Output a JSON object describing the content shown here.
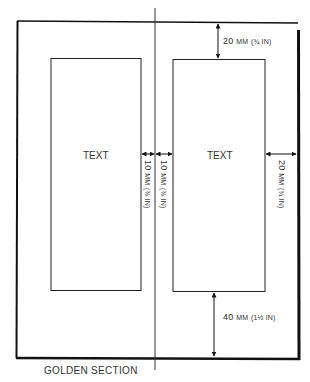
{
  "diagram": {
    "caption": "GOLDEN SECTION",
    "pages": [
      {
        "side": "left",
        "label": "TEXT"
      },
      {
        "side": "right",
        "label": "TEXT"
      }
    ],
    "dimensions": {
      "top_margin": {
        "value": "20",
        "unit": "MM",
        "imperial": "(¾ IN)"
      },
      "inner_margin_left": {
        "value": "10",
        "unit": "MM",
        "imperial": "(⅜ IN)"
      },
      "inner_margin_right": {
        "value": "10",
        "unit": "MM",
        "imperial": "(⅜ IN)"
      },
      "outer_margin": {
        "value": "20",
        "unit": "MM",
        "imperial": "(¾ IN)"
      },
      "bottom_margin": {
        "value": "40",
        "unit": "MM",
        "imperial": "(1½ IN)"
      }
    }
  }
}
